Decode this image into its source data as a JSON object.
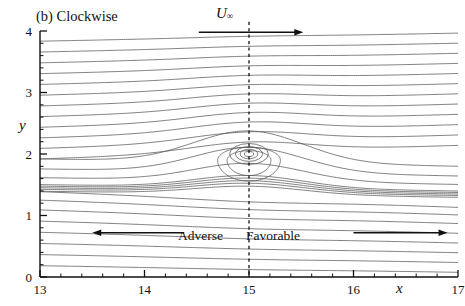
{
  "figure": {
    "panel_label": "(b) Clockwise",
    "freestream_label": "U",
    "freestream_sub": "∞",
    "adverse_label": "Adverse",
    "favorable_label": "Favorable",
    "line_color": "#555555",
    "axis_color": "#111111"
  },
  "chart_data": {
    "type": "line",
    "title": "(b) Clockwise",
    "xlabel": "x",
    "ylabel": "y",
    "xlim": [
      13,
      17
    ],
    "ylim": [
      0,
      4
    ],
    "xticks": [
      13,
      14,
      15,
      16,
      17
    ],
    "xticklabels": [
      "13",
      "14",
      "15",
      "16",
      "17"
    ],
    "yticks": [
      0,
      1,
      2,
      3,
      4
    ],
    "yticklabels": [
      "0",
      "1",
      "2",
      "3",
      "4"
    ],
    "xminor_step": 0.2,
    "yminor_step": 0.2,
    "grid": false,
    "legend": null,
    "annotations": [
      {
        "text": "U∞",
        "x": 15.0,
        "y": 4.12,
        "type": "freestream-velocity"
      },
      {
        "text": "Adverse",
        "x": 14.62,
        "y": 0.72,
        "type": "pressure-gradient-region"
      },
      {
        "text": "Favorable",
        "x": 15.38,
        "y": 0.72,
        "type": "pressure-gradient-region"
      }
    ],
    "arrows": [
      {
        "name": "freestream-arrow",
        "x_start": 14.52,
        "x_end": 15.52,
        "y": 3.98,
        "direction": "right"
      },
      {
        "name": "adverse-arrow",
        "x_start": 14.38,
        "x_end": 13.5,
        "y": 0.72,
        "direction": "left"
      },
      {
        "name": "favorable-arrow",
        "x_start": 16.0,
        "x_end": 16.9,
        "y": 0.72,
        "direction": "right"
      }
    ],
    "vertical_dashed_line": {
      "x": 15.0,
      "y_start": 0.0,
      "y_end": 4.15
    },
    "vortex": {
      "sense": "clockwise",
      "center_x": 15.0,
      "center_y": 2.0,
      "core_radii": [
        0.045,
        0.085,
        0.13,
        0.185
      ],
      "separatrix_cusp_y": 1.72
    },
    "streamlines": {
      "description": "Horizontal streamlines deflected by a clockwise point vortex at (15,2); upper lines rise to the right, lower lines fall to the right, with a dense shear cluster near y=1.4 that bulges upward under the vortex.",
      "inlet_y_values": [
        0.13,
        0.3,
        0.47,
        0.64,
        0.81,
        0.98,
        1.13,
        1.26,
        1.345,
        1.375,
        1.4,
        1.425,
        1.45,
        1.56,
        1.7,
        1.86,
        2.03,
        2.2,
        2.37,
        2.54,
        2.71,
        2.88,
        3.05,
        3.22,
        3.39,
        3.56,
        3.73,
        3.9
      ],
      "shear_cluster_range": [
        1.34,
        1.46
      ],
      "deflection_strength": 0.3,
      "shear_strength": 0.55
    }
  }
}
